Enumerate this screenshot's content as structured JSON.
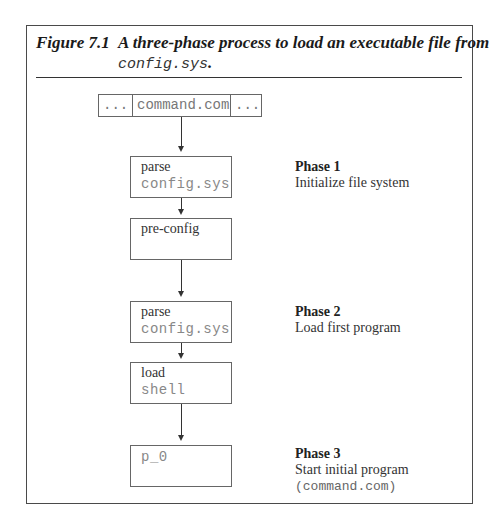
{
  "figure": {
    "label": "Figure 7.1",
    "caption_line1": "A three-phase process to load an executable file from",
    "caption_line2_mono": "config.sys",
    "caption_line2_suffix": "."
  },
  "memory_strip": {
    "cells": [
      "...",
      "command.com",
      "..."
    ]
  },
  "boxes": [
    {
      "line1": "parse",
      "line2": "config.sys"
    },
    {
      "line1": "pre-config",
      "line2": ""
    },
    {
      "line1": "parse",
      "line2": "config.sys"
    },
    {
      "line1": "load",
      "line2": "shell"
    },
    {
      "line1": "",
      "line2": "p_0"
    }
  ],
  "phases": [
    {
      "title": "Phase 1",
      "description": "Initialize file system"
    },
    {
      "title": "Phase 2",
      "description": "Load first program"
    },
    {
      "title": "Phase 3",
      "description": "Start initial program",
      "extra_mono": "(command.com)"
    }
  ]
}
